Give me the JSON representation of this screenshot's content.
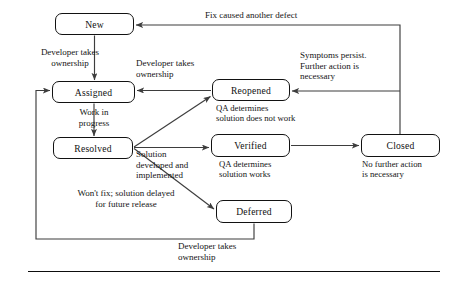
{
  "diagram": {
    "type": "state-transition-diagram",
    "stroke_color": "#3d3d3d",
    "node_border_color": "#121212",
    "text_color": "#141414",
    "nodes": [
      {
        "id": "new",
        "label": "New",
        "x": 55,
        "y": 13,
        "w": 79,
        "h": 22
      },
      {
        "id": "assigned",
        "label": "Assigned",
        "x": 52,
        "y": 81,
        "w": 83,
        "h": 22
      },
      {
        "id": "resolved",
        "label": "Resolved",
        "x": 53,
        "y": 137,
        "w": 80,
        "h": 22
      },
      {
        "id": "reopened",
        "label": "Reopened",
        "x": 212,
        "y": 79,
        "w": 78,
        "h": 22
      },
      {
        "id": "verified",
        "label": "Verified",
        "x": 211,
        "y": 134,
        "w": 79,
        "h": 23
      },
      {
        "id": "deferred",
        "label": "Deferred",
        "x": 216,
        "y": 200,
        "w": 76,
        "h": 23
      },
      {
        "id": "closed",
        "label": "Closed",
        "x": 361,
        "y": 134,
        "w": 79,
        "h": 23
      }
    ],
    "edge_labels": [
      {
        "id": "new-to-assigned",
        "text": "Developer takes\nownership",
        "x": 14,
        "y": 47,
        "w": 112,
        "align": "center"
      },
      {
        "id": "assigned-to-resolved",
        "text": "Work in\nprogress",
        "x": 58,
        "y": 107,
        "w": 72,
        "align": "center"
      },
      {
        "id": "reopened-to-assigned",
        "text": "Developer takes\nownership",
        "x": 136,
        "y": 58,
        "w": 103,
        "align": "left"
      },
      {
        "id": "closed-to-new",
        "text": "Fix caused another defect",
        "x": 205,
        "y": 10,
        "w": 165,
        "align": "left"
      },
      {
        "id": "closed-to-reopened",
        "text": "Symptoms persist.\nFurther action is\nnecessary",
        "x": 300,
        "y": 50,
        "w": 100,
        "align": "left"
      },
      {
        "id": "resolved-to-verified",
        "text": "Solution\ndeveloped and\nimplemented",
        "x": 136,
        "y": 149,
        "w": 96,
        "align": "left"
      },
      {
        "id": "resolved-to-deferred",
        "text": "Won't fix; solution delayed\nfor future release",
        "x": 48,
        "y": 188,
        "w": 156,
        "align": "center"
      },
      {
        "id": "deferred-to-assigned",
        "text": "Developer takes\nownership",
        "x": 178,
        "y": 241,
        "w": 110,
        "align": "left"
      }
    ],
    "node_notes": [
      {
        "id": "reopened-note",
        "text": "QA determines\nsolution does not work",
        "x": 216,
        "y": 103,
        "w": 126,
        "align": "left"
      },
      {
        "id": "verified-note",
        "text": "QA determines\nsolution works",
        "x": 219,
        "y": 159,
        "w": 104,
        "align": "left"
      },
      {
        "id": "closed-note",
        "text": "No further action\nis necessary",
        "x": 362,
        "y": 159,
        "w": 104,
        "align": "left"
      }
    ]
  }
}
